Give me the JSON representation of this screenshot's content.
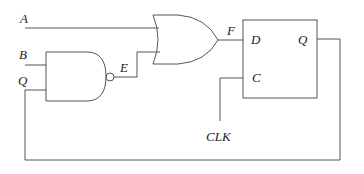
{
  "diagram": {
    "title": "",
    "type": "logic-circuit",
    "colors": {
      "line": "#555555",
      "text": "#222222",
      "background": "#ffffff"
    },
    "inputs": [
      {
        "id": "A",
        "label": "A"
      },
      {
        "id": "B",
        "label": "B"
      },
      {
        "id": "Q_in",
        "label": "Q"
      },
      {
        "id": "CLK",
        "label": "CLK"
      }
    ],
    "signals": {
      "E": "E",
      "F": "F"
    },
    "gates": [
      {
        "id": "nand",
        "type": "NAND",
        "inputs": [
          "B",
          "Q"
        ],
        "output": "E"
      },
      {
        "id": "or",
        "type": "OR",
        "inputs": [
          "A",
          "E"
        ],
        "output": "F"
      }
    ],
    "flipflop": {
      "type": "D flip-flop",
      "pins": {
        "d": "D",
        "c": "C",
        "q": "Q"
      }
    },
    "connections": [
      "A -> OR.in1",
      "B -> NAND.in1",
      "Q -> NAND.in2",
      "NAND.out (E) -> OR.in2",
      "OR.out (F) -> FF.D",
      "CLK -> FF.C",
      "FF.Q -> Q (feedback)"
    ]
  }
}
